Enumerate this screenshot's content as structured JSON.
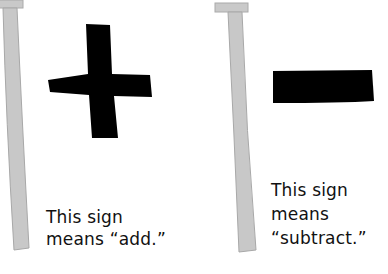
{
  "panels": [
    {
      "sign": "plus",
      "sign_icon": "plus-icon",
      "caption_lines": [
        "This sign",
        "means “add.”"
      ]
    },
    {
      "sign": "minus",
      "sign_icon": "minus-icon",
      "caption_lines": [
        "This sign",
        "means",
        "“subtract.”"
      ]
    }
  ],
  "colors": {
    "pole_fill": "#c8c8c8",
    "pole_stroke": "#a8a8a8",
    "sign": "#000000",
    "text": "#111111",
    "background": "#ffffff"
  }
}
